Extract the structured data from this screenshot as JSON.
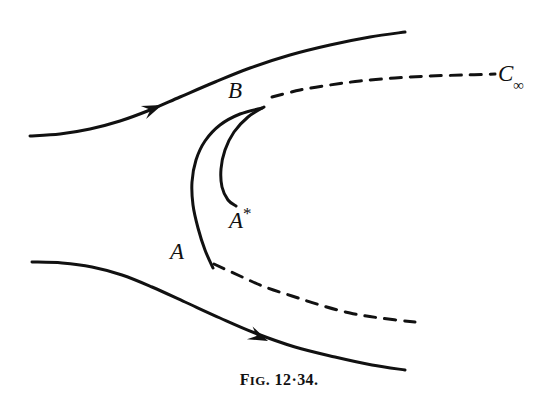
{
  "figure": {
    "caption_prefix": "F",
    "caption_smallcaps": "IG",
    "caption_number": ". 12·34.",
    "caption_full": "FIG. 12·34.",
    "background_color": "#ffffff",
    "ink_color": "#111111"
  },
  "labels": {
    "B": "B",
    "A_star_base": "A",
    "A_star_sup": "*",
    "A": "A",
    "C_base": "C",
    "C_sub": "∞"
  },
  "chart_data": {
    "type": "line",
    "title": "FIG. 12·34.",
    "xlabel": "",
    "ylabel": "",
    "xlim": [
      0,
      558
    ],
    "ylim": [
      403,
      0
    ],
    "grid": false,
    "legend": "none",
    "annotations": [
      {
        "text": "B",
        "x": 236,
        "y": 94,
        "style": "italic-serif"
      },
      {
        "text": "A*",
        "x": 240,
        "y": 220,
        "style": "italic-serif"
      },
      {
        "text": "A",
        "x": 180,
        "y": 256,
        "style": "italic-serif"
      },
      {
        "text": "C∞",
        "x": 512,
        "y": 78,
        "style": "italic-serif"
      }
    ],
    "series": [
      {
        "name": "upper-streamline",
        "style": "solid",
        "stroke": "#111111",
        "width": 3.0,
        "arrow_at": {
          "x": 162,
          "y": 105,
          "angle_deg": -22
        },
        "points": [
          [
            30,
            136
          ],
          [
            60,
            134
          ],
          [
            90,
            129
          ],
          [
            120,
            121
          ],
          [
            150,
            110
          ],
          [
            180,
            97
          ],
          [
            215,
            82
          ],
          [
            250,
            68
          ],
          [
            290,
            55
          ],
          [
            330,
            45
          ],
          [
            370,
            37
          ],
          [
            405,
            32
          ]
        ]
      },
      {
        "name": "lower-streamline",
        "style": "solid",
        "stroke": "#111111",
        "width": 3.0,
        "arrow_at": {
          "x": 268,
          "y": 341,
          "angle_deg": 24
        },
        "points": [
          [
            32,
            262
          ],
          [
            62,
            263
          ],
          [
            92,
            267
          ],
          [
            122,
            275
          ],
          [
            152,
            287
          ],
          [
            185,
            302
          ],
          [
            220,
            318
          ],
          [
            255,
            333
          ],
          [
            295,
            347
          ],
          [
            335,
            357
          ],
          [
            372,
            365
          ],
          [
            405,
            370
          ]
        ]
      },
      {
        "name": "upper-dashed-branch",
        "style": "dashed",
        "stroke": "#111111",
        "width": 3.0,
        "dash": [
          11,
          9
        ],
        "points": [
          [
            272,
            97
          ],
          [
            300,
            90
          ],
          [
            330,
            85
          ],
          [
            360,
            81
          ],
          [
            395,
            78
          ],
          [
            430,
            76
          ],
          [
            465,
            75
          ],
          [
            495,
            74
          ]
        ]
      },
      {
        "name": "lower-dashed-branch",
        "style": "dashed",
        "stroke": "#111111",
        "width": 3.0,
        "dash": [
          11,
          9
        ],
        "points": [
          [
            214,
            264
          ],
          [
            240,
            276
          ],
          [
            265,
            287
          ],
          [
            292,
            296
          ],
          [
            320,
            305
          ],
          [
            350,
            313
          ],
          [
            380,
            318
          ],
          [
            415,
            322
          ]
        ]
      },
      {
        "name": "outer-body-curve-A-to-B",
        "style": "solid",
        "stroke": "#111111",
        "width": 3.0,
        "points": [
          [
            262,
            108
          ],
          [
            240,
            114
          ],
          [
            220,
            125
          ],
          [
            205,
            141
          ],
          [
            196,
            160
          ],
          [
            192,
            182
          ],
          [
            193,
            205
          ],
          [
            198,
            228
          ],
          [
            205,
            250
          ],
          [
            213,
            268
          ]
        ]
      },
      {
        "name": "inner-body-curve-Astar-to-B",
        "style": "solid",
        "stroke": "#111111",
        "width": 3.0,
        "points": [
          [
            264,
            107
          ],
          [
            248,
            117
          ],
          [
            234,
            132
          ],
          [
            225,
            150
          ],
          [
            221,
            169
          ],
          [
            222,
            187
          ],
          [
            228,
            200
          ],
          [
            236,
            206
          ]
        ]
      }
    ]
  }
}
